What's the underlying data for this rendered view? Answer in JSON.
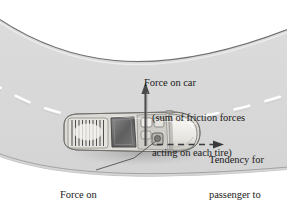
{
  "figure": {
    "name": "car-on-curve-force-diagram",
    "type": "physics-illustration",
    "width": 287,
    "height": 204,
    "background_color": "#ffffff",
    "road_color": "#d8d8d8",
    "road_edge_color": "#6e6e6e",
    "lane_marking_color": "#ffffff",
    "arrow_color": "#4a4a4a",
    "text_color": "#1a1a1a"
  },
  "annotations": {
    "force_on_car": {
      "line1": "Force on car",
      "line2": "(sum of friction forces",
      "line3": "acting on each tire)",
      "arrow": "up-arrow-solid"
    },
    "tendency": {
      "line1": "Tendency for",
      "line2": "passenger to",
      "line3": "go straight",
      "arrow": "right-arrow-dashed"
    },
    "force_on_passenger": {
      "line1": "Force on",
      "line2": "passenger",
      "arrow": "leader-line"
    }
  },
  "car": {
    "name": "car-top-view",
    "heading": "right",
    "body_color": "#e8e6e1",
    "window_color": "#6a6a6a",
    "shadow_color": "#b5b5b5"
  }
}
